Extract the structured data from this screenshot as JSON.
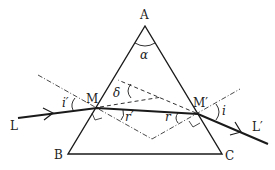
{
  "diagram": {
    "type": "prism-refraction",
    "labels": {
      "apex": "A",
      "base_left": "B",
      "base_right": "C",
      "entry_point": "M",
      "exit_point": "M′",
      "incident_ray": "L",
      "emergent_ray": "L′",
      "apex_angle": "α",
      "deviation_angle": "δ",
      "entry_incidence_angle": "i′",
      "entry_refraction_angle": "r′",
      "exit_refraction_angle": "r",
      "exit_emergence_angle": "i"
    },
    "colors": {
      "stroke": "#1a1a1a",
      "background": "#ffffff"
    }
  }
}
